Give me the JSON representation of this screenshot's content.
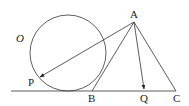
{
  "diagram": {
    "type": "geometry",
    "circle": {
      "label": "O",
      "cx": 68,
      "cy": 53,
      "r": 38
    },
    "baseline": {
      "x1": 11,
      "y1": 91,
      "x2": 176,
      "y2": 91
    },
    "points": {
      "A": {
        "label": "A",
        "x": 134,
        "y": 22
      },
      "B": {
        "label": "B",
        "x": 92,
        "y": 91
      },
      "C": {
        "label": "C",
        "x": 176,
        "y": 91
      },
      "Q": {
        "label": "Q",
        "x": 144,
        "y": 91
      },
      "P": {
        "label": "P",
        "x": 39,
        "y": 77
      }
    },
    "segments": [
      {
        "from": "A",
        "to": "B"
      },
      {
        "from": "A",
        "to": "C"
      }
    ],
    "vectors": [
      {
        "from": "A",
        "to": "P"
      },
      {
        "from": "A",
        "to": "Q"
      }
    ],
    "labels": {
      "O": "O",
      "A": "A",
      "B": "B",
      "C": "C",
      "P": "P",
      "Q": "Q"
    }
  }
}
